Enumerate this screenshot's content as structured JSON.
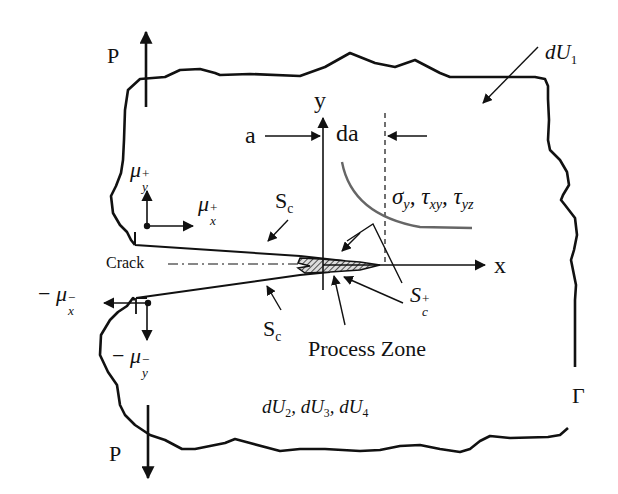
{
  "diagram": {
    "labels": {
      "load_top": "P",
      "load_bottom": "P",
      "energy_region_1": {
        "base": "dU",
        "sub": "1"
      },
      "energy_region_2": {
        "text": "dU",
        "sub2": "2",
        "sep1": ", dU",
        "sub3": "3",
        "sep2": ", dU",
        "sub4": "4"
      },
      "crack_length": "a",
      "crack_increment": "da",
      "axis_y": "y",
      "axis_x": "x",
      "crack": "Crack",
      "crack_surface_upper": {
        "base": "S",
        "sub": "c"
      },
      "crack_surface_lower": {
        "base": "S",
        "sub": "c"
      },
      "crack_surface_tip": {
        "base": "S",
        "sub": "c",
        "sup": "+"
      },
      "process_zone": "Process Zone",
      "boundary": "Γ",
      "stresses": {
        "s1": "σ",
        "s1_sub": "y",
        "sep1": ", ",
        "s2": "τ",
        "s2_sub": "xy",
        "sep2": ", ",
        "s3": "τ",
        "s3_sub": "yz"
      },
      "disp_x_plus": {
        "base": "μ",
        "sub": "x",
        "sup": "+"
      },
      "disp_y_plus": {
        "base": "μ",
        "sub": "y",
        "sup": "+"
      },
      "disp_x_minus": {
        "prefix": "− ",
        "base": "μ",
        "sub": "x",
        "sup": "−"
      },
      "disp_y_minus": {
        "prefix": "− ",
        "base": "μ",
        "sub": "y",
        "sup": "−"
      }
    },
    "colors": {
      "line": "#111111",
      "stress_curve": "#666666",
      "background": "#ffffff"
    }
  }
}
